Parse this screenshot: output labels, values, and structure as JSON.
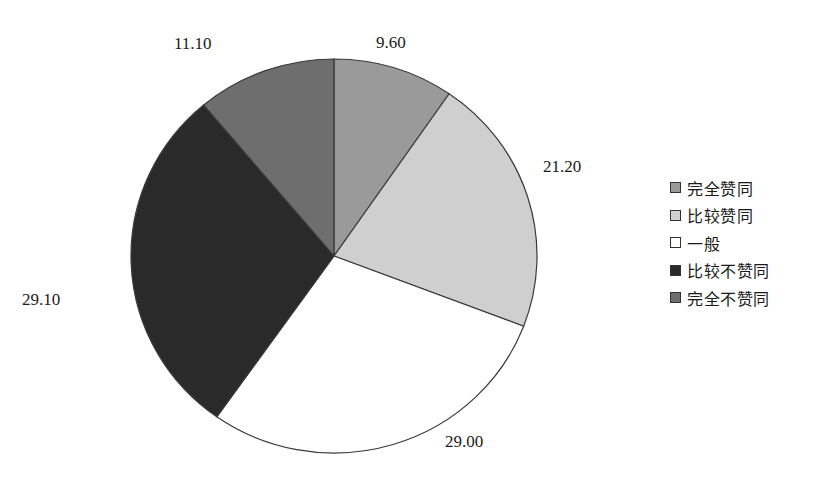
{
  "chart_data": {
    "type": "pie",
    "title": "",
    "start_angle_deg": 0,
    "direction": "clockwise",
    "categories": [
      "完全赞同",
      "比较赞同",
      "一般",
      "比较不赞同",
      "完全不赞同"
    ],
    "values": [
      9.6,
      21.2,
      29.0,
      29.1,
      11.1
    ],
    "value_labels": [
      "9.60",
      "21.20",
      "29.00",
      "29.10",
      "11.10"
    ],
    "colors": [
      "#9a9a9a",
      "#cfcfcf",
      "#ffffff",
      "#2a2a2a",
      "#6e6e6e"
    ],
    "legend_position": "right",
    "unit": "%"
  },
  "legend": {
    "items": [
      {
        "label": "完全赞同",
        "color": "#9a9a9a"
      },
      {
        "label": "比较赞同",
        "color": "#cfcfcf"
      },
      {
        "label": "一般",
        "color": "#ffffff"
      },
      {
        "label": "比较不赞同",
        "color": "#2a2a2a"
      },
      {
        "label": "完全不赞同",
        "color": "#6e6e6e"
      }
    ]
  },
  "labels": {
    "slice_0": "9.60",
    "slice_1": "21.20",
    "slice_2": "29.00",
    "slice_3": "29.10",
    "slice_4": "11.10"
  }
}
